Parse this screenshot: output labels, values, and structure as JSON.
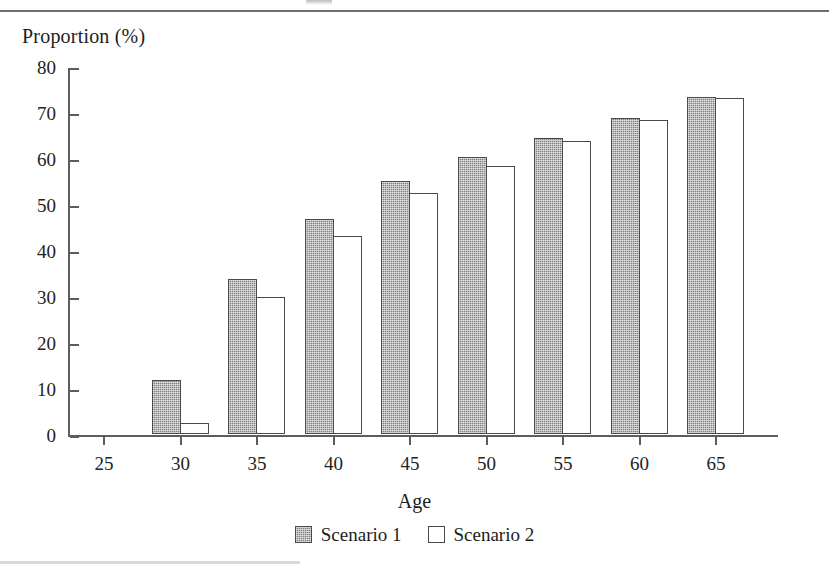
{
  "page": {
    "top_rule": true,
    "bottom_rule": true
  },
  "chart_data": {
    "type": "bar",
    "title": "",
    "xlabel": "Age",
    "ylabel": "Proportion (%)",
    "categories": [
      "25",
      "30",
      "35",
      "40",
      "45",
      "50",
      "55",
      "60",
      "65"
    ],
    "series": [
      {
        "name": "Scenario 1",
        "fill": "#808080",
        "pattern": "dithered-gray",
        "values": [
          0,
          11.7,
          33.6,
          46.8,
          55.1,
          60.3,
          64.3,
          68.6,
          73.2
        ]
      },
      {
        "name": "Scenario 2",
        "fill": "#ffffff",
        "pattern": "outline",
        "values": [
          0,
          2.3,
          29.7,
          43.1,
          52.5,
          58.2,
          63.8,
          68.3,
          73.0
        ]
      }
    ],
    "ylim": [
      0,
      80
    ],
    "ytick_labels": [
      "0",
      "10",
      "20",
      "30",
      "40",
      "50",
      "60",
      "70",
      "80"
    ],
    "ytick_values": [
      0,
      10,
      20,
      30,
      40,
      50,
      60,
      70,
      80
    ],
    "xtick_labels": [
      "25",
      "30",
      "35",
      "40",
      "45",
      "50",
      "55",
      "60",
      "65"
    ],
    "grid": false,
    "legend_position": "bottom-center",
    "legend_entries": [
      "Scenario 1",
      "Scenario 2"
    ],
    "axis_color": "#5d5d5d"
  }
}
